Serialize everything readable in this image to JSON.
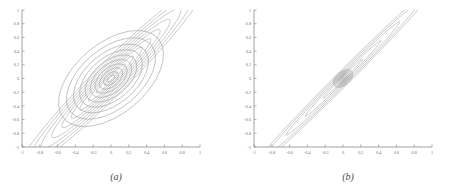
{
  "figure": {
    "background": "#ffffff",
    "line_color": "#9a9a9a",
    "line_color_alt": "#a8a8a8",
    "axis_color": "#8c8c8c",
    "tick_label_color": "#6b6b6b"
  },
  "panels": [
    {
      "id": "a",
      "caption": "(a)"
    },
    {
      "id": "b",
      "caption": "(b)"
    }
  ],
  "chart_data": [
    {
      "type": "line",
      "panel": "a",
      "title": "",
      "subtitle": "",
      "xlabel": "",
      "ylabel": "",
      "xlim": [
        -1,
        1
      ],
      "ylim": [
        -1,
        1
      ],
      "grid": false,
      "legend": "none",
      "xticks": [
        -1,
        -0.8,
        -0.6,
        -0.4,
        -0.2,
        0,
        0.2,
        0.4,
        0.6,
        0.8,
        1
      ],
      "yticks": [
        -1,
        -0.8,
        -0.6,
        -0.4,
        -0.2,
        0,
        0.2,
        0.4,
        0.6,
        0.8,
        1
      ],
      "xticklabels": [
        "-1",
        "-0.8",
        "-0.6",
        "-0.4",
        "-0.2",
        "0",
        "0.2",
        "0.4",
        "0.6",
        "0.8",
        "1"
      ],
      "yticklabels": [
        "-1",
        "-0.8",
        "-0.6",
        "-0.4",
        "-0.2",
        "0",
        "0.2",
        "0.4",
        "0.6",
        "0.8",
        "1"
      ],
      "description": "Contour plot of two superimposed bivariate Gaussian densities centered at the origin. Family 1: broad nearly circular contours, mildly tilted. Family 2: narrow, strongly correlated contours along the 45 degree diagonal.",
      "series": [
        {
          "name": "broad-contours",
          "kind": "gaussian-ellipse-family",
          "center": [
            0.0,
            0.0
          ],
          "rotation_deg": 40,
          "sigma_major": 0.62,
          "sigma_minor": 0.46,
          "levels": [
            0.08,
            0.16,
            0.25,
            0.34,
            0.44,
            0.55,
            0.67,
            0.8,
            0.95,
            1.12
          ],
          "count": 10
        },
        {
          "name": "narrow-diagonal-contours",
          "kind": "gaussian-ellipse-family",
          "center": [
            0.0,
            0.0
          ],
          "rotation_deg": 45,
          "sigma_major": 1.05,
          "sigma_minor": 0.17,
          "levels": [
            0.1,
            0.22,
            0.34,
            0.47,
            0.6,
            0.74,
            0.89,
            1.05,
            1.22,
            1.4
          ],
          "count": 10
        }
      ]
    },
    {
      "type": "line",
      "panel": "b",
      "title": "",
      "subtitle": "",
      "xlabel": "",
      "ylabel": "",
      "xlim": [
        -1,
        1
      ],
      "ylim": [
        -1,
        1
      ],
      "grid": false,
      "legend": "none",
      "xticks": [
        -1,
        -0.8,
        -0.6,
        -0.4,
        -0.2,
        0,
        0.2,
        0.4,
        0.6,
        0.8,
        1
      ],
      "yticks": [
        -1,
        -0.8,
        -0.6,
        -0.4,
        -0.2,
        0,
        0.2,
        0.4,
        0.6,
        0.8,
        1
      ],
      "xticklabels": [
        "-1",
        "-0.8",
        "-0.6",
        "-0.4",
        "-0.2",
        "0",
        "0.2",
        "0.4",
        "0.6",
        "0.8",
        "1"
      ],
      "yticklabels": [
        "-1",
        "-0.8",
        "-0.6",
        "-0.4",
        "-0.2",
        "0",
        "0.2",
        "0.4",
        "0.6",
        "0.8",
        "1"
      ],
      "description": "Contour plot of two superimposed bivariate Gaussian densities centered at the origin. Family 1: tight concentric near-circular contours of small radius. Family 2: extremely elongated, highly correlated contours along the 45 degree diagonal spanning the full plot.",
      "series": [
        {
          "name": "tight-central-contours",
          "kind": "gaussian-ellipse-family",
          "center": [
            0.0,
            0.0
          ],
          "rotation_deg": 40,
          "sigma_major": 0.22,
          "sigma_minor": 0.17,
          "levels": [
            0.05,
            0.1,
            0.16,
            0.22,
            0.28,
            0.35,
            0.42,
            0.5,
            0.58
          ],
          "count": 9
        },
        {
          "name": "elongated-diagonal-contours",
          "kind": "gaussian-ellipse-family",
          "center": [
            0.0,
            0.0
          ],
          "rotation_deg": 45,
          "sigma_major": 1.25,
          "sigma_minor": 0.085,
          "levels": [
            0.25,
            0.48,
            0.72,
            0.96,
            1.2
          ],
          "count": 5
        }
      ]
    }
  ]
}
